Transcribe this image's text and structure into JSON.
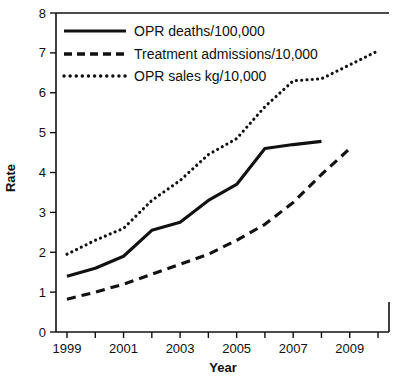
{
  "chart_data": {
    "type": "line",
    "title": "",
    "xlabel": "Year",
    "ylabel": "Rate",
    "xlim": [
      1999,
      2010
    ],
    "ylim": [
      0,
      8
    ],
    "ytick_step": 1,
    "yticks": [
      0,
      1,
      2,
      3,
      4,
      5,
      6,
      7,
      8
    ],
    "ytick_labels": [
      "0",
      "1",
      "2",
      "3",
      "4",
      "5",
      "6",
      "7",
      "8"
    ],
    "x": [
      1999,
      2000,
      2001,
      2002,
      2003,
      2004,
      2005,
      2006,
      2007,
      2008,
      2009,
      2010
    ],
    "xtick_labels": [
      "1999",
      "",
      "2001",
      "",
      "2003",
      "",
      "2005",
      "",
      "2007",
      "",
      "2009",
      ""
    ],
    "xticks_all": [
      1999,
      2000,
      2001,
      2002,
      2003,
      2004,
      2005,
      2006,
      2007,
      2008,
      2009,
      2010
    ],
    "grid": false,
    "legend_position": "top-left",
    "series": [
      {
        "name": "OPR deaths/100,000",
        "style": "solid",
        "color": "#111111",
        "x": [
          1999,
          2000,
          2001,
          2002,
          2003,
          2004,
          2005,
          2006,
          2007,
          2008
        ],
        "values": [
          1.4,
          1.6,
          1.9,
          2.55,
          2.75,
          3.3,
          3.7,
          4.6,
          4.7,
          4.78
        ]
      },
      {
        "name": "Treatment admissions/10,000",
        "style": "dashed",
        "color": "#111111",
        "x": [
          1999,
          2000,
          2001,
          2002,
          2003,
          2004,
          2005,
          2006,
          2007,
          2008,
          2009
        ],
        "values": [
          0.82,
          1.0,
          1.2,
          1.45,
          1.7,
          1.95,
          2.3,
          2.7,
          3.25,
          3.95,
          4.6
        ]
      },
      {
        "name": "OPR sales kg/10,000",
        "style": "dotted",
        "color": "#111111",
        "x": [
          1999,
          2000,
          2001,
          2002,
          2003,
          2004,
          2005,
          2006,
          2007,
          2008,
          2009,
          2010
        ],
        "values": [
          1.95,
          2.3,
          2.6,
          3.3,
          3.8,
          4.45,
          4.85,
          5.65,
          6.3,
          6.35,
          6.7,
          7.05
        ]
      }
    ]
  },
  "legend": {
    "entries": [
      {
        "label": "OPR deaths/100,000",
        "style": "solid"
      },
      {
        "label": "Treatment admissions/10,000",
        "style": "dashed"
      },
      {
        "label": "OPR sales kg/10,000",
        "style": "dotted"
      }
    ]
  },
  "axes": {
    "x_title": "Year",
    "y_title": "Rate"
  }
}
